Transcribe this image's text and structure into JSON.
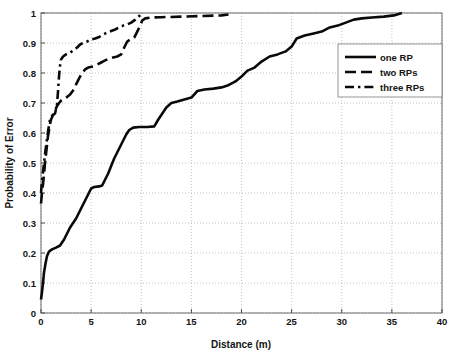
{
  "chart_data": {
    "type": "line",
    "title": "",
    "xlabel": "Distance (m)",
    "ylabel": "Probability of Error",
    "xlim": [
      0,
      40
    ],
    "ylim": [
      0,
      1
    ],
    "grid": true,
    "legend_position": "right",
    "xticks": [
      "0",
      "5",
      "10",
      "15",
      "20",
      "25",
      "30",
      "35",
      "40"
    ],
    "xtick_values": [
      0,
      5,
      10,
      15,
      20,
      25,
      30,
      35,
      40
    ],
    "yticks": [
      "0",
      "0.1",
      "0.2",
      "0.3",
      "0.4",
      "0.5",
      "0.6",
      "0.7",
      "0.8",
      "0.9",
      "1"
    ],
    "ytick_values": [
      0,
      0.1,
      0.2,
      0.3,
      0.4,
      0.5,
      0.6,
      0.7,
      0.8,
      0.9,
      1
    ],
    "series": [
      {
        "name": "one RP",
        "style": "solid",
        "color": "#0a0a0a",
        "points": [
          [
            0.0,
            0.045
          ],
          [
            0.1,
            0.07
          ],
          [
            0.2,
            0.1
          ],
          [
            0.3,
            0.135
          ],
          [
            0.45,
            0.165
          ],
          [
            0.6,
            0.19
          ],
          [
            0.8,
            0.205
          ],
          [
            1.1,
            0.212
          ],
          [
            1.5,
            0.218
          ],
          [
            1.9,
            0.225
          ],
          [
            2.3,
            0.245
          ],
          [
            2.6,
            0.265
          ],
          [
            2.9,
            0.285
          ],
          [
            3.2,
            0.3
          ],
          [
            3.5,
            0.315
          ],
          [
            3.8,
            0.335
          ],
          [
            4.1,
            0.355
          ],
          [
            4.4,
            0.375
          ],
          [
            4.7,
            0.395
          ],
          [
            5.0,
            0.415
          ],
          [
            5.3,
            0.42
          ],
          [
            5.8,
            0.422
          ],
          [
            6.1,
            0.425
          ],
          [
            6.4,
            0.445
          ],
          [
            6.7,
            0.465
          ],
          [
            7.0,
            0.49
          ],
          [
            7.3,
            0.515
          ],
          [
            7.6,
            0.535
          ],
          [
            7.9,
            0.555
          ],
          [
            8.2,
            0.575
          ],
          [
            8.5,
            0.595
          ],
          [
            8.8,
            0.61
          ],
          [
            9.2,
            0.618
          ],
          [
            9.8,
            0.62
          ],
          [
            10.6,
            0.62
          ],
          [
            11.3,
            0.622
          ],
          [
            11.7,
            0.645
          ],
          [
            12.1,
            0.665
          ],
          [
            12.5,
            0.685
          ],
          [
            13.0,
            0.7
          ],
          [
            13.6,
            0.705
          ],
          [
            14.3,
            0.712
          ],
          [
            15.0,
            0.718
          ],
          [
            15.6,
            0.74
          ],
          [
            16.3,
            0.745
          ],
          [
            17.2,
            0.748
          ],
          [
            18.0,
            0.752
          ],
          [
            18.6,
            0.758
          ],
          [
            19.4,
            0.772
          ],
          [
            20.0,
            0.788
          ],
          [
            20.6,
            0.808
          ],
          [
            21.3,
            0.818
          ],
          [
            22.0,
            0.838
          ],
          [
            22.8,
            0.855
          ],
          [
            23.6,
            0.862
          ],
          [
            24.4,
            0.872
          ],
          [
            25.0,
            0.888
          ],
          [
            25.5,
            0.915
          ],
          [
            26.3,
            0.925
          ],
          [
            27.2,
            0.932
          ],
          [
            28.0,
            0.938
          ],
          [
            28.8,
            0.952
          ],
          [
            29.6,
            0.958
          ],
          [
            30.4,
            0.968
          ],
          [
            31.2,
            0.978
          ],
          [
            32.0,
            0.982
          ],
          [
            33.0,
            0.985
          ],
          [
            34.2,
            0.988
          ],
          [
            35.2,
            0.992
          ],
          [
            36.0,
            1.0
          ]
        ]
      },
      {
        "name": "two RPs",
        "style": "dashed",
        "color": "#0a0a0a",
        "points": [
          [
            0.0,
            0.365
          ],
          [
            0.1,
            0.4
          ],
          [
            0.2,
            0.43
          ],
          [
            0.3,
            0.46
          ],
          [
            0.4,
            0.5
          ],
          [
            0.5,
            0.53
          ],
          [
            0.6,
            0.56
          ],
          [
            0.7,
            0.59
          ],
          [
            0.8,
            0.61
          ],
          [
            0.9,
            0.63
          ],
          [
            1.0,
            0.645
          ],
          [
            1.2,
            0.66
          ],
          [
            1.4,
            0.675
          ],
          [
            1.6,
            0.69
          ],
          [
            1.8,
            0.7
          ],
          [
            2.0,
            0.708
          ],
          [
            2.3,
            0.715
          ],
          [
            2.6,
            0.72
          ],
          [
            2.9,
            0.728
          ],
          [
            3.2,
            0.742
          ],
          [
            3.5,
            0.762
          ],
          [
            3.8,
            0.782
          ],
          [
            4.1,
            0.8
          ],
          [
            4.4,
            0.812
          ],
          [
            4.7,
            0.818
          ],
          [
            5.2,
            0.822
          ],
          [
            5.6,
            0.828
          ],
          [
            6.0,
            0.835
          ],
          [
            6.4,
            0.842
          ],
          [
            6.8,
            0.848
          ],
          [
            7.2,
            0.852
          ],
          [
            7.6,
            0.855
          ],
          [
            8.0,
            0.862
          ],
          [
            8.3,
            0.885
          ],
          [
            8.6,
            0.905
          ],
          [
            8.9,
            0.912
          ],
          [
            9.3,
            0.918
          ],
          [
            9.6,
            0.938
          ],
          [
            9.9,
            0.958
          ],
          [
            10.1,
            0.975
          ],
          [
            10.4,
            0.982
          ],
          [
            11.0,
            0.985
          ],
          [
            12.0,
            0.986
          ],
          [
            14.0,
            0.988
          ],
          [
            16.0,
            0.99
          ],
          [
            18.0,
            0.992
          ],
          [
            18.7,
            0.995
          ]
        ]
      },
      {
        "name": "three RPs",
        "style": "dashdot",
        "color": "#0a0a0a",
        "points": [
          [
            0.0,
            0.4
          ],
          [
            0.1,
            0.44
          ],
          [
            0.2,
            0.47
          ],
          [
            0.3,
            0.5
          ],
          [
            0.4,
            0.53
          ],
          [
            0.5,
            0.555
          ],
          [
            0.6,
            0.58
          ],
          [
            0.7,
            0.605
          ],
          [
            0.8,
            0.625
          ],
          [
            0.9,
            0.645
          ],
          [
            1.0,
            0.655
          ],
          [
            1.2,
            0.66
          ],
          [
            1.4,
            0.665
          ],
          [
            1.6,
            0.695
          ],
          [
            1.7,
            0.74
          ],
          [
            1.8,
            0.79
          ],
          [
            1.9,
            0.825
          ],
          [
            2.0,
            0.845
          ],
          [
            2.2,
            0.855
          ],
          [
            2.5,
            0.862
          ],
          [
            2.9,
            0.868
          ],
          [
            3.2,
            0.875
          ],
          [
            3.6,
            0.885
          ],
          [
            3.9,
            0.895
          ],
          [
            4.2,
            0.9
          ],
          [
            4.6,
            0.905
          ],
          [
            5.0,
            0.912
          ],
          [
            5.4,
            0.915
          ],
          [
            5.8,
            0.92
          ],
          [
            6.2,
            0.928
          ],
          [
            6.6,
            0.935
          ],
          [
            7.0,
            0.94
          ],
          [
            7.4,
            0.945
          ],
          [
            7.8,
            0.952
          ],
          [
            8.2,
            0.958
          ],
          [
            8.6,
            0.962
          ],
          [
            9.0,
            0.968
          ],
          [
            9.4,
            0.978
          ],
          [
            9.8,
            0.99
          ],
          [
            10.0,
            1.0
          ]
        ]
      }
    ]
  },
  "legend": {
    "entries": [
      {
        "label": "one RP",
        "style": "solid"
      },
      {
        "label": "two RPs",
        "style": "dashed"
      },
      {
        "label": "three RPs",
        "style": "dashdot"
      }
    ]
  }
}
